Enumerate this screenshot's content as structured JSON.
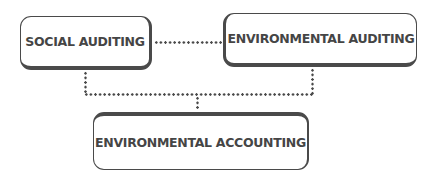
{
  "diagram": {
    "nodes": [
      {
        "id": "social-auditing",
        "label": "SOCIAL AUDITING"
      },
      {
        "id": "environmental-auditing",
        "label": "ENVIRONMENTAL AUDITING"
      },
      {
        "id": "environmental-accounting",
        "label": "ENVIRONMENTAL ACCOUNTING"
      }
    ],
    "edges": [
      {
        "from": "social-auditing",
        "to": "environmental-auditing",
        "style": "dotted"
      },
      {
        "from": "social-auditing",
        "to": "environmental-accounting",
        "style": "dotted"
      },
      {
        "from": "environmental-auditing",
        "to": "environmental-accounting",
        "style": "dotted"
      }
    ],
    "colors": {
      "border": "#4a4a4a",
      "text": "#454545",
      "background": "#ffffff"
    }
  }
}
